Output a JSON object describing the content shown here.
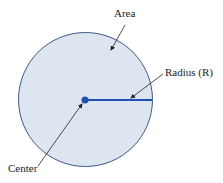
{
  "diagram": {
    "labels": {
      "area": "Area",
      "radius": "Radius (R)",
      "center": "Center"
    },
    "colors": {
      "fill": "#dde6f0",
      "outline": "#3d5a8a",
      "radius_line": "#1f4fb3",
      "center_dot": "#1f4fb3",
      "arrow": "#222222"
    }
  }
}
